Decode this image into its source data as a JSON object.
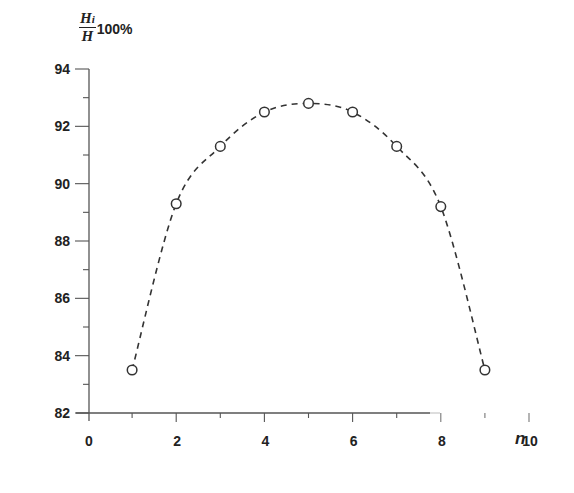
{
  "chart_data": {
    "type": "line",
    "title": "",
    "xlabel": "n",
    "ylabel": "Hi/H 100%",
    "ylabel_parts": {
      "numerator": "H",
      "numerator_sub": "i",
      "denominator": "H",
      "suffix": "100%"
    },
    "xlim": [
      0,
      10
    ],
    "ylim": [
      82,
      94
    ],
    "x_ticks": [
      0,
      2,
      4,
      6,
      8,
      10
    ],
    "y_ticks": [
      82,
      84,
      86,
      88,
      90,
      92,
      94
    ],
    "x_tick_labels": [
      "0",
      "2",
      "4",
      "6",
      "8",
      "10"
    ],
    "y_tick_labels": [
      "82",
      "84",
      "86",
      "88",
      "90",
      "92",
      "94"
    ],
    "grid": false,
    "legend": null,
    "series": [
      {
        "name": "Hi/H",
        "line_style": "dashed",
        "marker": "open-circle",
        "color": "#333333",
        "x": [
          1,
          2,
          3,
          4,
          5,
          6,
          7,
          8,
          9
        ],
        "values": [
          83.5,
          89.3,
          91.3,
          92.5,
          92.8,
          92.5,
          91.3,
          89.2,
          83.5
        ]
      }
    ]
  }
}
